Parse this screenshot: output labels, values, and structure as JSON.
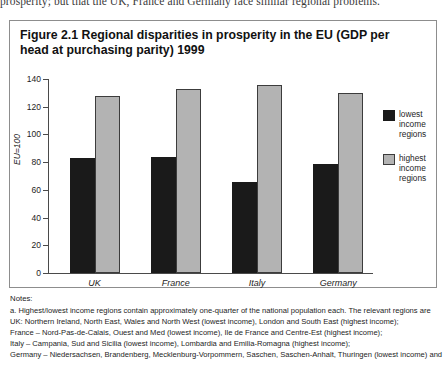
{
  "running_text": "prosperity; but that the UK, France and Germany face similar regional problems.",
  "figure": {
    "title": "Figure 2.1 Regional disparities in prosperity in the EU (GDP per head at purchasing parity) 1999"
  },
  "chart_data": {
    "type": "bar",
    "title": "Figure 2.1 Regional disparities in prosperity in the EU (GDP per head at purchasing parity) 1999",
    "xlabel": "",
    "ylabel": "EU=100",
    "categories": [
      "UK",
      "France",
      "Italy",
      "Germany"
    ],
    "series": [
      {
        "name": "lowest income regions",
        "values": [
          83,
          84,
          66,
          79
        ],
        "color": "#1a1a1a"
      },
      {
        "name": "highest income regions",
        "values": [
          128,
          133,
          136,
          130
        ],
        "color": "#b3b3b3"
      }
    ],
    "ylim": [
      0,
      140
    ],
    "yticks": [
      0,
      20,
      40,
      60,
      80,
      100,
      120,
      140
    ],
    "ytick_labels": [
      "0",
      "20",
      "40",
      "60",
      "80",
      "100",
      "120",
      "140"
    ],
    "grid": false,
    "legend_position": "right"
  },
  "legend": [
    {
      "label": "lowest income regions",
      "color": "#1a1a1a"
    },
    {
      "label": "highest income regions",
      "color": "#b3b3b3"
    }
  ],
  "notes": {
    "heading": "Notes:",
    "lines": [
      "a. Highest/lowest income regions contain approximately one-quarter of the national population each. The relevant regions are",
      "UK: Northern Ireland, North East, Wales and North West (lowest income), London and South East (highest income);",
      "France – Nord-Pas-de-Calais, Ouest and Med (lowest income), Ile de France and Centre-Est (highest income);",
      "Italy – Campania, Sud and Sicilia (lowest income), Lombardia and Emilia-Romagna (highest income);",
      "Germany – Niedersachsen, Brandenberg, Mecklenburg-Vorpommern, Saschen, Saschen-Anhalt, Thuringen (lowest income) and"
    ]
  }
}
